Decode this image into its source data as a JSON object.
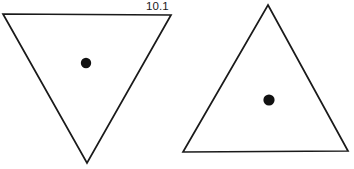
{
  "canvas": {
    "width": 354,
    "height": 169,
    "background_color": "#ffffff",
    "stroke_color": "#1a1a1a",
    "dot_color": "#111111",
    "stroke_width": 1.7
  },
  "figures": [
    {
      "label": "10.1",
      "shape_name": "inverted-triangle",
      "orientation": "point-down",
      "vertices": [
        [
          3,
          14
        ],
        [
          171,
          15
        ],
        [
          87,
          163
        ]
      ],
      "dot": {
        "cx": 86,
        "cy": 63,
        "r": 5.2
      },
      "label_position": {
        "x": 146,
        "y": 0
      }
    },
    {
      "label": "10.2",
      "shape_name": "upright-triangle",
      "orientation": "point-up",
      "vertices": [
        [
          268,
          5
        ],
        [
          348,
          151
        ],
        [
          183,
          152
        ]
      ],
      "dot": {
        "cx": 269,
        "cy": 100,
        "r": 5.6
      },
      "label_position": {
        "x": 325,
        "y": 0
      }
    }
  ]
}
